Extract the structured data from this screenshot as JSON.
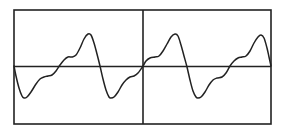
{
  "diagram": {
    "title": "",
    "colors": {
      "background": "#ffffff",
      "frame": "#222222",
      "axis": "#222222",
      "waveform": "#222222"
    },
    "frame": {
      "x": 14,
      "y": 10,
      "width": 257,
      "height": 114
    },
    "axis_y": 66.5,
    "center_divider_x": 143
  },
  "chart_data": {
    "type": "line",
    "title": "",
    "xlabel": "",
    "ylabel": "",
    "grid": false,
    "periods": 2,
    "note": "Pixel coordinates of the waveform trace (x, y) within the 286x134 image; y=66.5 is the zero axis",
    "points": [
      [
        14,
        66
      ],
      [
        16,
        76
      ],
      [
        19,
        88
      ],
      [
        22,
        96
      ],
      [
        24,
        98
      ],
      [
        27,
        97
      ],
      [
        31,
        92
      ],
      [
        36,
        84
      ],
      [
        40,
        79
      ],
      [
        44,
        77
      ],
      [
        48,
        76
      ],
      [
        52,
        75
      ],
      [
        56,
        71
      ],
      [
        60,
        65
      ],
      [
        64,
        60
      ],
      [
        68,
        57
      ],
      [
        72,
        57
      ],
      [
        76,
        55
      ],
      [
        80,
        48
      ],
      [
        84,
        39
      ],
      [
        88,
        34
      ],
      [
        91,
        35
      ],
      [
        94,
        43
      ],
      [
        97,
        54
      ],
      [
        100,
        66
      ],
      [
        103,
        79
      ],
      [
        106,
        90
      ],
      [
        109,
        97
      ],
      [
        111,
        98
      ],
      [
        114,
        97
      ],
      [
        118,
        92
      ],
      [
        122,
        85
      ],
      [
        126,
        80
      ],
      [
        130,
        77
      ],
      [
        134,
        76
      ],
      [
        138,
        73
      ],
      [
        143,
        66
      ],
      [
        146,
        61
      ],
      [
        150,
        58
      ],
      [
        155,
        57
      ],
      [
        159,
        56
      ],
      [
        163,
        51
      ],
      [
        167,
        44
      ],
      [
        171,
        37
      ],
      [
        175,
        34
      ],
      [
        178,
        36
      ],
      [
        181,
        45
      ],
      [
        184,
        56
      ],
      [
        187,
        67
      ],
      [
        190,
        80
      ],
      [
        193,
        91
      ],
      [
        196,
        97
      ],
      [
        198,
        98
      ],
      [
        201,
        97
      ],
      [
        205,
        92
      ],
      [
        209,
        85
      ],
      [
        213,
        80
      ],
      [
        217,
        78
      ],
      [
        222,
        77
      ],
      [
        226,
        73
      ],
      [
        230,
        66
      ],
      [
        234,
        61
      ],
      [
        238,
        58
      ],
      [
        242,
        57
      ],
      [
        246,
        56
      ],
      [
        250,
        51
      ],
      [
        254,
        43
      ],
      [
        258,
        37
      ],
      [
        261,
        35
      ],
      [
        264,
        38
      ],
      [
        267,
        48
      ],
      [
        269,
        57
      ],
      [
        271,
        66
      ]
    ]
  }
}
